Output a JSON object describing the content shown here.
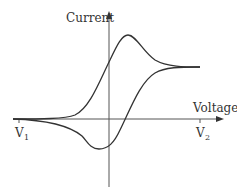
{
  "diagram": {
    "colors": {
      "line": "#333333",
      "axis": "#555555",
      "background": "#ffffff"
    },
    "axes": {
      "y_label": "Current",
      "x_label": "Voltage",
      "ticks": [
        {
          "name": "V",
          "sub": "1"
        },
        {
          "name": "V",
          "sub": "2"
        }
      ]
    },
    "curve": {
      "description": "Closed loop with anodic peak above axis and cathodic trough below axis, converging at V1 and V2"
    }
  }
}
